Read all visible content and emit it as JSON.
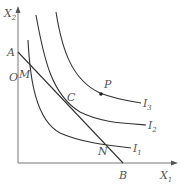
{
  "axes": {
    "x_label": "X",
    "x_sub": "1",
    "y_label": "X",
    "y_sub": "2",
    "origin": "O"
  },
  "points": {
    "A": "A",
    "B": "B",
    "M": "M",
    "C": "C",
    "N": "N",
    "P": "P"
  },
  "curves": [
    {
      "label": "I",
      "sub": "1"
    },
    {
      "label": "I",
      "sub": "2"
    },
    {
      "label": "I",
      "sub": "3"
    }
  ]
}
